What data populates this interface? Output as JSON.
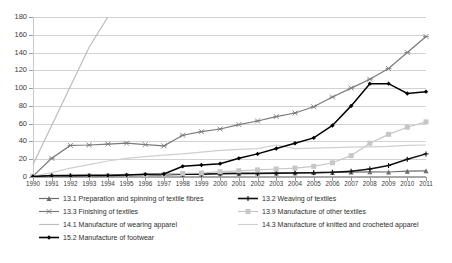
{
  "chart_data": {
    "type": "line",
    "title": "",
    "xlabel": "",
    "ylabel": "",
    "ylim": [
      0,
      180
    ],
    "ytick_step": 20,
    "grid": true,
    "legend_position": "bottom",
    "categories": [
      "1990",
      "1991",
      "1992",
      "1993",
      "1994",
      "1995",
      "1996",
      "1997",
      "1998",
      "1999",
      "2000",
      "2001",
      "2002",
      "2003",
      "2004",
      "2005",
      "2006",
      "2007",
      "2008",
      "2009",
      "2010",
      "2011"
    ],
    "yticks": [
      "0",
      "20",
      "40",
      "60",
      "80",
      "100",
      "120",
      "140",
      "160",
      "180"
    ],
    "series": [
      {
        "name": "13.1 Preparation and spinning of textile fibres",
        "color": "#6e6e6e",
        "marker": "triangle",
        "values": [
          0.6,
          1.8,
          1.9,
          1.9,
          1.8,
          2.0,
          2.4,
          3.0,
          3.2,
          3.4,
          4.2,
          4.3,
          4.4,
          4.6,
          4.8,
          5.0,
          5.2,
          5.5,
          5.8,
          5.6,
          6.6,
          7.0
        ]
      },
      {
        "name": "13.2 Weaving of textiles",
        "color": "#111111",
        "marker": "plus",
        "values": [
          0.5,
          1.5,
          1.6,
          1.6,
          1.6,
          1.7,
          2.2,
          2.6,
          3.0,
          3.2,
          3.6,
          3.8,
          4.0,
          4.2,
          4.5,
          4.8,
          5.3,
          6.5,
          9.0,
          13.0,
          20.0,
          26.0
        ]
      },
      {
        "name": "13.3 Finishing of textiles",
        "color": "#7a7a7a",
        "marker": "star",
        "values": [
          1.0,
          21.0,
          35.5,
          36.0,
          37.0,
          38.0,
          36.5,
          35.0,
          47.0,
          51.0,
          54.0,
          59.0,
          63.0,
          68.0,
          72.0,
          79.0,
          90.0,
          100.0,
          110.0,
          122.0,
          140.0,
          158.0
        ]
      },
      {
        "name": "13.9 Manufacture of other textiles",
        "color": "#c6c6c6",
        "marker": "square",
        "values": [
          0.4,
          1.0,
          1.2,
          1.3,
          1.4,
          1.6,
          2.2,
          3.0,
          4.0,
          4.5,
          6.0,
          7.0,
          8.0,
          9.0,
          10.0,
          12.0,
          16.0,
          24.0,
          38.0,
          48.0,
          56.0,
          62.0
        ]
      },
      {
        "name": "14.1 Manufacture of wearing apparel",
        "color": "#bdbdbd",
        "marker": "none",
        "values": [
          14.0,
          58.0,
          102.0,
          146.0,
          180.0,
          null,
          null,
          null,
          null,
          null,
          null,
          null,
          null,
          null,
          null,
          null,
          null,
          null,
          null,
          null,
          null,
          null
        ]
      },
      {
        "name": "14.3 Manufacture of knitted and crocheted apparel",
        "color": "#cfcfcf",
        "marker": "none",
        "values": [
          0.8,
          5.0,
          10.0,
          14.0,
          18.0,
          21.0,
          23.0,
          24.5,
          26.0,
          28.0,
          30.0,
          31.0,
          32.0,
          36.0,
          32.0,
          32.5,
          33.0,
          33.5,
          34.0,
          34.5,
          35.5,
          36.0
        ]
      },
      {
        "name": "15.2 Manufacture of footwear",
        "color": "#000000",
        "marker": "diamond",
        "values": [
          0.6,
          1.4,
          1.5,
          1.6,
          1.8,
          2.2,
          3.0,
          3.4,
          12.0,
          13.5,
          15.0,
          21.0,
          26.0,
          32.0,
          38.0,
          44.0,
          58.0,
          80.0,
          105.0,
          105.0,
          94.0,
          96.0
        ]
      }
    ]
  },
  "legend": {
    "entries": [
      {
        "label": "13.1 Preparation and spinning of textile fibres"
      },
      {
        "label": "13.2 Weaving of textiles"
      },
      {
        "label": "13.3 Finishing of textiles"
      },
      {
        "label": "13.9 Manufacture of other textiles"
      },
      {
        "label": "14.1 Manufacture of wearing apparel"
      },
      {
        "label": "14.3 Manufacture of knitted and crocheted apparel"
      },
      {
        "label": "15.2 Manufacture of footwear"
      }
    ]
  }
}
